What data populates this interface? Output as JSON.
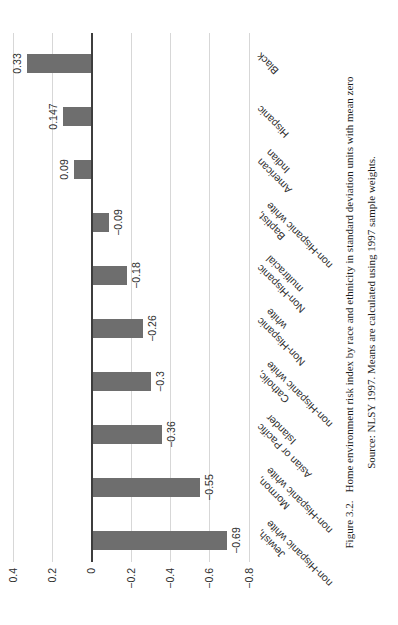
{
  "figure": {
    "caption_label": "Figure 3.2.",
    "caption_text": "Home environment risk index by race and ethnicity in standard deviation units with mean zero",
    "source_text": "Source: NLSY 1997. Means are calculated using 1997 sample weights."
  },
  "chart_data": {
    "type": "bar",
    "title": "",
    "xlabel": "",
    "ylabel": "",
    "orientation": "vertical bars; entire figure printed rotated 90° counterclockwise on portrait page",
    "categories": [
      "Jewish,\nnon-Hispanic white",
      "Mormon,\nnon-Hispanic white",
      "Asian or Pacific\nIslander",
      "Catholic,\nnon-Hispanic white",
      "Non-Hispanic\nwhite",
      "Non-Hispanic\nmultiracial",
      "Baptist,\nnon-Hispanic white",
      "American\nIndian",
      "Hispanic",
      "Black"
    ],
    "values": [
      -0.69,
      -0.55,
      -0.36,
      -0.3,
      -0.26,
      -0.18,
      -0.09,
      0.09,
      0.147,
      0.33
    ],
    "value_labels": [
      "−0.69",
      "−0.55",
      "−0.36",
      "−0.3",
      "−0.26",
      "−0.18",
      "−0.09",
      "0.09",
      "0.147",
      "0.33"
    ],
    "axis_ticks": [
      "0.4",
      "0.2",
      "0",
      "−0.2",
      "−0.4",
      "−0.6",
      "−0.8"
    ],
    "axis_tick_values": [
      0.4,
      0.2,
      0,
      -0.2,
      -0.4,
      -0.6,
      -0.8
    ],
    "ylim": [
      -0.8,
      0.4
    ],
    "grid": true,
    "legend": "none",
    "colors": {
      "bar": "#6e6e6e",
      "zero_axis": "#3d3d3d",
      "gridline": "#d7d7d7",
      "label_text": "#2e2e2e"
    }
  }
}
